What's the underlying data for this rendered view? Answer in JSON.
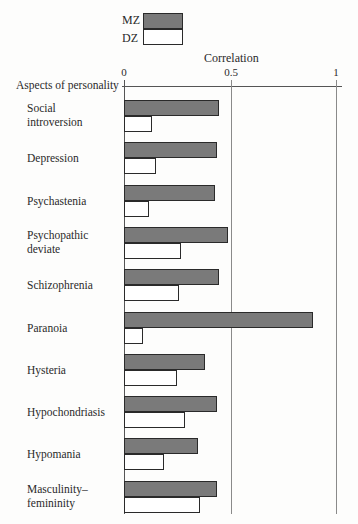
{
  "legend": {
    "items": [
      {
        "label": "MZ",
        "color": "#7a7a7a"
      },
      {
        "label": "DZ",
        "color": "#ffffff"
      }
    ]
  },
  "axis": {
    "title": "Correlation",
    "y_title": "Aspects of personality",
    "ticks": [
      "0",
      "0.5",
      "1"
    ]
  },
  "chart_data": {
    "type": "bar",
    "orientation": "horizontal",
    "title": "",
    "xlabel": "Correlation",
    "ylabel": "Aspects of personality",
    "xlim": [
      0,
      1
    ],
    "xticks": [
      0,
      0.5,
      1
    ],
    "grid": "vertical lines at 0.5 and 1",
    "legend_position": "top",
    "categories": [
      "Social introversion",
      "Depression",
      "Psychastenia",
      "Psychopathic deviate",
      "Schizophrenia",
      "Paranoia",
      "Hysteria",
      "Hypochondriasis",
      "Hypomania",
      "Masculinity-femininity"
    ],
    "series": [
      {
        "name": "MZ",
        "values": [
          0.45,
          0.44,
          0.43,
          0.49,
          0.45,
          0.89,
          0.38,
          0.44,
          0.35,
          0.44
        ]
      },
      {
        "name": "DZ",
        "values": [
          0.13,
          0.15,
          0.12,
          0.27,
          0.26,
          0.09,
          0.25,
          0.29,
          0.19,
          0.36
        ]
      }
    ]
  },
  "rows": [
    {
      "label_line1": "Social",
      "label_line2": "introversion"
    },
    {
      "label_line1": "Depression",
      "label_line2": ""
    },
    {
      "label_line1": "Psychastenia",
      "label_line2": ""
    },
    {
      "label_line1": "Psychopathic",
      "label_line2": "deviate"
    },
    {
      "label_line1": "Schizophrenia",
      "label_line2": ""
    },
    {
      "label_line1": "Paranoia",
      "label_line2": ""
    },
    {
      "label_line1": "Hysteria",
      "label_line2": ""
    },
    {
      "label_line1": "Hypochondriasis",
      "label_line2": ""
    },
    {
      "label_line1": "Hypomania",
      "label_line2": ""
    },
    {
      "label_line1": "Masculinity–",
      "label_line2": "femininity"
    }
  ]
}
